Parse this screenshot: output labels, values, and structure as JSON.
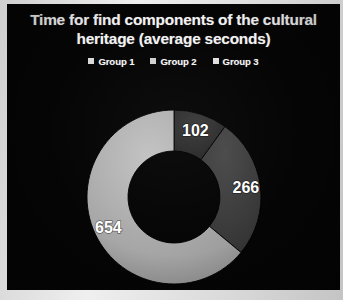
{
  "chart_data": {
    "type": "pie",
    "variant": "donut",
    "title": "Time for find components of the cultural heritage (average seconds)",
    "xlabel": "",
    "ylabel": "",
    "categories": [
      "Group 1",
      "Group 2",
      "Group 3"
    ],
    "values": [
      102,
      266,
      654
    ],
    "labels": [
      "102",
      "266",
      "654"
    ],
    "total": 1022,
    "legend": {
      "position": "top",
      "entries": [
        {
          "label": "Group 1",
          "color": "#2f2f2f",
          "swatch": "#d9d9d9"
        },
        {
          "label": "Group 2",
          "color": "#3d3d3d",
          "swatch": "#d0d0d0"
        },
        {
          "label": "Group 3",
          "color": "#a8a8a8",
          "swatch": "#e0e0e0"
        }
      ]
    },
    "slices": [
      {
        "name": "Group 1",
        "value": 102,
        "label": "102",
        "color": "#2d2d2d",
        "start_angle": 0,
        "end_angle": 35.9
      },
      {
        "name": "Group 2",
        "value": 266,
        "label": "266",
        "color": "#3d3d3d",
        "start_angle": 35.9,
        "end_angle": 129.6
      },
      {
        "name": "Group 3",
        "value": 654,
        "label": "654",
        "color": "#a8a8a8",
        "start_angle": 129.6,
        "end_angle": 360
      }
    ],
    "grid": false,
    "background": "#050505",
    "text_color": "#f2f2f2"
  },
  "frame": {
    "border_color": "#d8d8d8"
  }
}
